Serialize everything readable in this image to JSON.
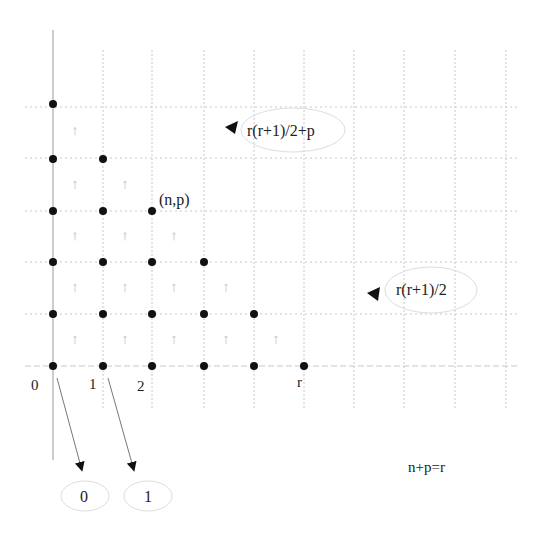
{
  "diagram": {
    "title": "",
    "grid": {
      "columns_x": [
        103,
        152,
        204,
        254,
        304,
        354,
        404,
        455,
        506
      ],
      "rows_y": [
        107,
        158,
        211,
        262,
        314,
        366
      ],
      "axis_x": 53,
      "color": "#c8c8c8"
    },
    "points": [
      {
        "n": 0,
        "p": 5
      },
      {
        "n": 0,
        "p": 4
      },
      {
        "n": 0,
        "p": 3
      },
      {
        "n": 0,
        "p": 2
      },
      {
        "n": 0,
        "p": 1
      },
      {
        "n": 0,
        "p": 0
      },
      {
        "n": 1,
        "p": 4
      },
      {
        "n": 1,
        "p": 3
      },
      {
        "n": 1,
        "p": 2
      },
      {
        "n": 1,
        "p": 1
      },
      {
        "n": 1,
        "p": 0
      },
      {
        "n": 2,
        "p": 3
      },
      {
        "n": 2,
        "p": 2
      },
      {
        "n": 2,
        "p": 1
      },
      {
        "n": 2,
        "p": 0
      },
      {
        "n": 3,
        "p": 2
      },
      {
        "n": 3,
        "p": 1
      },
      {
        "n": 3,
        "p": 0
      },
      {
        "n": 4,
        "p": 1
      },
      {
        "n": 4,
        "p": 0
      },
      {
        "n": 5,
        "p": 0
      }
    ],
    "axis_labels": {
      "zero": "0",
      "one": "1",
      "two": "2",
      "r": "r"
    },
    "point_label": "(n,p)",
    "annotations": {
      "top_formula": "r(r+1)/2+p",
      "middle_formula": "r(r+1)/2",
      "constraint": "n+p=r"
    },
    "output_nodes": [
      {
        "label": "0"
      },
      {
        "label": "1"
      }
    ],
    "colors": {
      "dot": "#111111",
      "grid": "#c8c8c8",
      "axis": "#9a9a9a",
      "arrow": "#777777",
      "ellipse": "#dddddd",
      "text": "#222222"
    }
  }
}
